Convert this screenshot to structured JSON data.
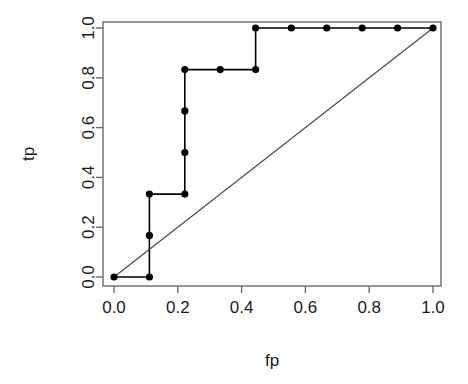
{
  "chart_data": {
    "type": "line",
    "title": "",
    "subtitle": "",
    "xlabel": "fp",
    "ylabel": "tp",
    "xlim": [
      0.0,
      1.0
    ],
    "ylim": [
      0.0,
      1.0
    ],
    "grid": false,
    "legend": null,
    "xticks": [
      0.0,
      0.2,
      0.4,
      0.6,
      0.8,
      1.0
    ],
    "yticks": [
      0.0,
      0.2,
      0.4,
      0.6,
      0.8,
      1.0
    ],
    "xtick_labels": [
      "0.0",
      "0.2",
      "0.4",
      "0.6",
      "0.8",
      "1.0"
    ],
    "ytick_labels": [
      "0.0",
      "0.2",
      "0.4",
      "0.6",
      "0.8",
      "1.0"
    ],
    "series": [
      {
        "name": "roc-curve",
        "type": "step-line-with-markers",
        "color": "#000000",
        "marker": "filled-circle",
        "x": [
          0.0,
          0.111,
          0.111,
          0.111,
          0.222,
          0.222,
          0.222,
          0.222,
          0.333,
          0.444,
          0.444,
          0.556,
          0.667,
          0.778,
          0.889,
          1.0
        ],
        "y": [
          0.0,
          0.0,
          0.167,
          0.333,
          0.333,
          0.5,
          0.667,
          0.833,
          0.833,
          0.833,
          1.0,
          1.0,
          1.0,
          1.0,
          1.0,
          1.0
        ]
      },
      {
        "name": "reference-diagonal",
        "type": "line",
        "color": "#444444",
        "marker": "none",
        "x": [
          0.0,
          1.0
        ],
        "y": [
          0.0,
          1.0
        ]
      }
    ],
    "annotations": []
  },
  "axes": {
    "x_axis_title": "fp",
    "y_axis_title": "tp"
  }
}
